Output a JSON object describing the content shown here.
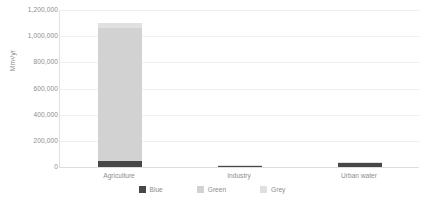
{
  "chart_data": {
    "type": "bar",
    "subtype": "stacked-bar",
    "title": "",
    "xlabel": "",
    "ylabel": "Mm³/yr",
    "categories": [
      "Agriculture",
      "Industry",
      "Urban water"
    ],
    "ylim": [
      0,
      1200000
    ],
    "ytick_values": [
      0,
      200000,
      400000,
      600000,
      800000,
      1000000,
      1200000
    ],
    "ytick_labels": [
      "0",
      "200,000",
      "400,000",
      "600,000",
      "800,000",
      "1,000,000",
      "1,200,000"
    ],
    "grid": true,
    "legend_position": "bottom",
    "series": [
      {
        "name": "Blue",
        "color": "#474747",
        "values": [
          45000,
          8000,
          30000
        ]
      },
      {
        "name": "Green",
        "color": "#d2d2d2",
        "values": [
          1020000,
          0,
          0
        ]
      },
      {
        "name": "Grey",
        "color": "#e0e0e0",
        "values": [
          35000,
          2000,
          5000
        ]
      }
    ],
    "totals": [
      1100000,
      10000,
      35000
    ]
  },
  "legend": {
    "items": [
      {
        "label": "Blue",
        "color": "#474747"
      },
      {
        "label": "Green",
        "color": "#d2d2d2"
      },
      {
        "label": "Grey",
        "color": "#e0e0e0"
      }
    ]
  }
}
